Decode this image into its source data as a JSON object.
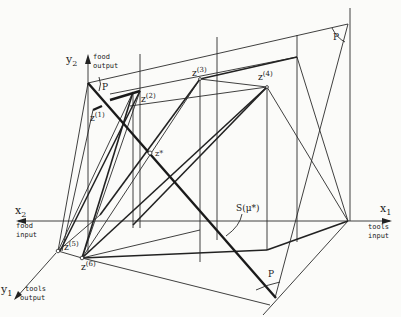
{
  "axes": {
    "y2": {
      "name": "y",
      "sub": "2",
      "line1": "food",
      "line2": "output"
    },
    "x2": {
      "name": "x",
      "sub": "2",
      "line1": "food",
      "line2": "input"
    },
    "x1": {
      "name": "x",
      "sub": "1",
      "line1": "tools",
      "line2": "input"
    },
    "y1": {
      "name": "y",
      "sub": "1",
      "line1": "tools",
      "line2": "output"
    }
  },
  "points": {
    "z1": {
      "base": "z",
      "sup": "(1)"
    },
    "z2": {
      "base": "z",
      "sup": "(2)"
    },
    "z3": {
      "base": "z",
      "sup": "(3)"
    },
    "z4": {
      "base": "z",
      "sup": "(4)"
    },
    "z5": {
      "base": "z",
      "sup": "(5)"
    },
    "z6": {
      "base": "z",
      "sup": "(6)"
    },
    "zstar": {
      "label": "z*"
    }
  },
  "labels": {
    "p_top_left": "P",
    "p_top_right": "P",
    "p_bottom": "P",
    "s_mu": "S(μ*)"
  }
}
